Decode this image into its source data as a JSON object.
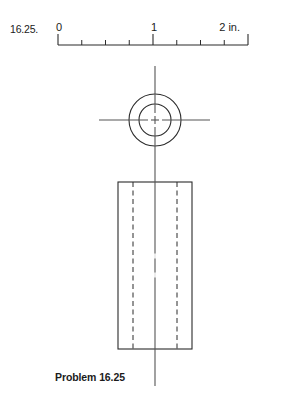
{
  "figure": {
    "problem_number": "16.25.",
    "caption": "Problem 16.25",
    "drawing_type": "orthographic-projection"
  },
  "scale": {
    "unit_label": "2 in.",
    "labels": [
      "0",
      "1",
      "2 in."
    ],
    "major_ticks": [
      0,
      1,
      2
    ],
    "minor_ticks_per_unit": 4,
    "x_start_px": 58,
    "x_end_px": 248,
    "baseline_y_px": 45,
    "major_tick_height_px": 11,
    "minor_tick_height_px": 5,
    "line_color": "#2b2b2b"
  },
  "top_view": {
    "name": "circle-top-view",
    "center_x_px": 155,
    "center_y_px": 120,
    "outer_radius_px": 26,
    "inner_radius_px": 16,
    "stroke_color": "#2b2b2b"
  },
  "front_view": {
    "name": "rectangle-front-view",
    "left_px": 118,
    "right_px": 192,
    "top_px": 182,
    "bottom_px": 349,
    "hidden_line_left_px": 133,
    "hidden_line_right_px": 177,
    "stroke_color": "#2b2b2b",
    "hidden_line_style": "dashed"
  },
  "centerlines": {
    "vertical_x_px": 155,
    "vertical_top_px": 66,
    "vertical_bottom_px": 386,
    "horizontal_y_px": 120,
    "horizontal_left_px": 99,
    "horizontal_right_px": 210,
    "color": "#555555",
    "style": "center-dash-dot"
  },
  "colors": {
    "background": "#ffffff",
    "ink": "#1b1b1b",
    "line": "#2b2b2b",
    "centerline": "#555555"
  }
}
